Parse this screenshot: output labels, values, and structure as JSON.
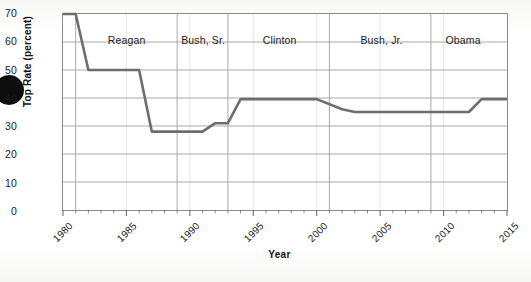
{
  "chart_data": {
    "type": "line",
    "title": "",
    "xlabel": "Year",
    "ylabel": "Top Rate (percent)",
    "xlim": [
      1980,
      2015
    ],
    "ylim": [
      0,
      70
    ],
    "grid": true,
    "legend_position": "none",
    "y_ticks": [
      0,
      10,
      20,
      30,
      40,
      50,
      60,
      70
    ],
    "y_tick_labels": [
      "0",
      "10",
      "20",
      "30",
      "40",
      "50",
      "60",
      "70"
    ],
    "x_ticks": [
      1980,
      1985,
      1990,
      1995,
      2000,
      2005,
      2010,
      2015
    ],
    "x_tick_labels": [
      "1980",
      "1985",
      "1990",
      "1995",
      "2000",
      "2005",
      "2010",
      "2015"
    ],
    "x_minor_tick_step": 1,
    "line_color": "#6d6d6d",
    "grid_color": "#a0a0a0",
    "axis_color": "#8a8a8a",
    "series": [
      {
        "name": "Top Rate (percent)",
        "x": [
          1980,
          1981,
          1982,
          1986,
          1987,
          1991,
          1992,
          1993,
          1994,
          2000,
          2002,
          2003,
          2012,
          2013,
          2015
        ],
        "values": [
          70,
          70,
          50,
          50,
          28,
          28,
          31,
          31,
          39.6,
          39.6,
          36,
          35,
          35,
          39.6,
          39.6
        ]
      }
    ],
    "annotations": [
      {
        "label": "Reagan",
        "start_year": 1981,
        "end_year": 1989,
        "center_year": 1985.0
      },
      {
        "label": "Bush, Sr.",
        "start_year": 1989,
        "end_year": 1993,
        "center_year": 1991.0
      },
      {
        "label": "Clinton",
        "start_year": 1993,
        "end_year": 2001,
        "center_year": 1997.0
      },
      {
        "label": "Bush, Jr.",
        "start_year": 2001,
        "end_year": 2009,
        "center_year": 2005.0
      },
      {
        "label": "Obama",
        "start_year": 2009,
        "end_year": 2015,
        "center_year": 2011.4
      }
    ],
    "divider_years": [
      1981,
      1989,
      1993,
      2001,
      2009
    ]
  }
}
